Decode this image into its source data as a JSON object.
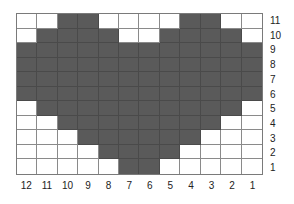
{
  "colors": {
    "filled": "#5a5a5a",
    "empty": "#ffffff",
    "gridline": "#8a8a8a"
  },
  "row_labels": [
    "11",
    "10",
    "9",
    "8",
    "7",
    "6",
    "5",
    "4",
    "3",
    "2",
    "1"
  ],
  "column_labels": [
    "12",
    "11",
    "10",
    "9",
    "8",
    "7",
    "6",
    "5",
    "4",
    "3",
    "2",
    "1"
  ],
  "grid": [
    "001100001100",
    "011110011110",
    "111111111111",
    "111111111111",
    "111111111111",
    "111111111111",
    "011111111110",
    "001111111100",
    "000111111000",
    "000011110000",
    "000001100000"
  ]
}
